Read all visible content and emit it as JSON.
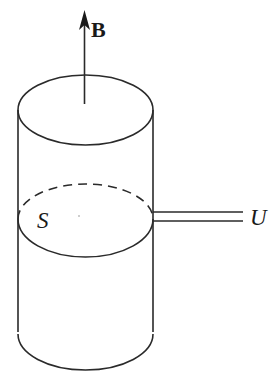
{
  "diagram": {
    "labels": {
      "field": "B",
      "area": "S",
      "voltage": "U"
    },
    "colors": {
      "stroke": "#2a2a2a",
      "background": "#ffffff"
    },
    "elements": [
      {
        "name": "magnetic-field-arrow",
        "direction": "up"
      },
      {
        "name": "cylinder-top-ellipse"
      },
      {
        "name": "cylinder-walls"
      },
      {
        "name": "loop-ellipse",
        "back_half": "dashed",
        "front_half": "solid"
      },
      {
        "name": "lead-wires",
        "count": 2
      },
      {
        "name": "cylinder-bottom-arc"
      }
    ]
  }
}
